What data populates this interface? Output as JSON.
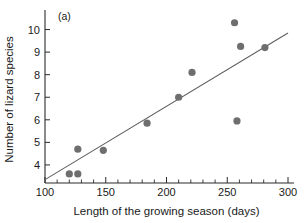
{
  "chart_data": {
    "type": "scatter",
    "title": "",
    "panel_label": "(a)",
    "xlabel": "Length of the growing season (days)",
    "ylabel": "Number of lizard species",
    "xlim": [
      100,
      300
    ],
    "ylim": [
      3.2,
      10.6
    ],
    "xticks": [
      100,
      150,
      200,
      250,
      300
    ],
    "xtick_labels": [
      "100",
      "150",
      "200",
      "250",
      "300"
    ],
    "x_minor_tick_step": 10,
    "yticks": [
      4,
      5,
      6,
      7,
      8,
      9,
      10
    ],
    "ytick_labels": [
      "4",
      "5",
      "6",
      "7",
      "8",
      "9",
      "10"
    ],
    "grid": false,
    "legend": null,
    "points": [
      {
        "x": 120,
        "y": 3.6
      },
      {
        "x": 127,
        "y": 3.6
      },
      {
        "x": 127,
        "y": 4.7
      },
      {
        "x": 148,
        "y": 4.65
      },
      {
        "x": 184,
        "y": 5.85
      },
      {
        "x": 210,
        "y": 7.0
      },
      {
        "x": 221,
        "y": 8.1
      },
      {
        "x": 256,
        "y": 10.3
      },
      {
        "x": 258,
        "y": 5.95
      },
      {
        "x": 261,
        "y": 9.25
      },
      {
        "x": 281,
        "y": 9.2
      }
    ],
    "trendline": {
      "x1": 100,
      "y1": 3.35,
      "x2": 300,
      "y2": 9.85
    },
    "marker_color": "#6e6e6e",
    "line_color": "#5d5d5d",
    "axis_color": "#2b2b2b",
    "text_color": "#1a1a1a",
    "background_color": "#ffffff"
  }
}
